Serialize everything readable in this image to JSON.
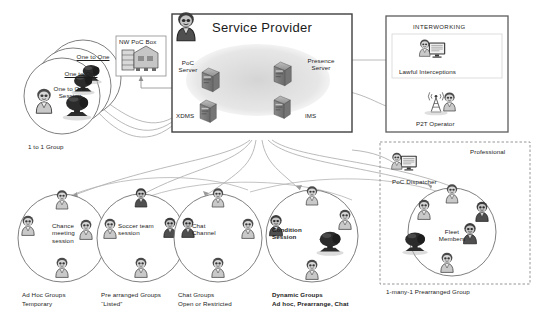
{
  "diagram": {
    "service_provider": {
      "title": "Service Provider",
      "nodes": [
        {
          "id": "poc-server",
          "label": "PoC\nServer"
        },
        {
          "id": "presence-server",
          "label": "Presence\nServer"
        },
        {
          "id": "xdms",
          "label": "XDMS"
        },
        {
          "id": "ims",
          "label": "IMS"
        }
      ],
      "operator_avatar": "operator-avatar-icon"
    },
    "nw_poc_box": {
      "label": "NW PoC Box",
      "icon": "server-rack-icon"
    },
    "one_to_one": {
      "stack": [
        "One to One",
        "One to One",
        "One to One\nSession"
      ],
      "caption": "1 to 1 Group",
      "icons": [
        "person-icon",
        "camera-icon"
      ]
    },
    "interworking": {
      "title": "INTERWORKING",
      "items": [
        {
          "id": "lawful-interceptions",
          "label": "Lawful Interceptions",
          "icon": "monitor-person-icon"
        },
        {
          "id": "p2t-operator",
          "label": "P2T Operator",
          "icon": "antenna-person-icon"
        }
      ]
    },
    "professional": {
      "title": "Professional",
      "dispatcher": {
        "label": "PoC Dispatcher",
        "icon": "monitor-person-icon"
      },
      "fleet": {
        "label": "Fleet\nMembers",
        "icon": "camera-icon"
      },
      "caption": "1-many-1 Prearranged Group"
    },
    "groups": [
      {
        "id": "ad-hoc",
        "session_label": "Chance\nmeeting\nsession",
        "caption_line1": "Ad Hoc Groups",
        "caption_line2": "Temporary",
        "bold": false
      },
      {
        "id": "pre-arranged",
        "session_label": "Soccer team\nsession",
        "caption_line1": "Pre arranged Groups",
        "caption_line2": "“Listed”",
        "bold": false
      },
      {
        "id": "chat",
        "session_label": "Chat\nChannel",
        "caption_line1": "Chat Groups",
        "caption_line2": "Open or Restricted",
        "bold": false
      },
      {
        "id": "dynamic",
        "session_label": "Condition\nSession",
        "caption_line1": "Dynamic Groups",
        "caption_line2": "Ad hoc, Prearrange, Chat",
        "bold": true
      }
    ],
    "colors": {
      "ink": "#1a1a1a",
      "box_border": "#4a4a4a",
      "circle_stroke": "#6e6e6e",
      "connector": "#9a9a9a",
      "cloud": "#dcdcdc",
      "server_body": "#9a9a9a",
      "server_dark": "#6b6b6b",
      "person_light": "#cfcfcf",
      "person_dark": "#555555",
      "camera": "#2e2e2e",
      "panel_bg": "#ffffff",
      "dash_border": "#8a8a8a"
    }
  }
}
